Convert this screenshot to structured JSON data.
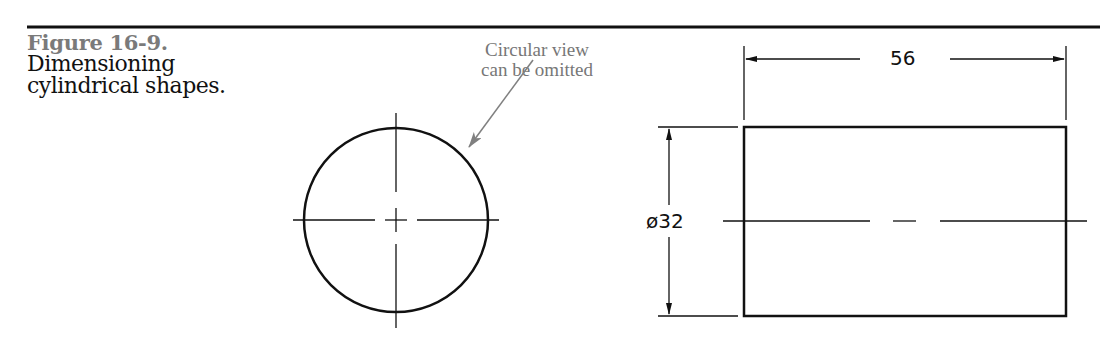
{
  "figure": {
    "number": "Figure 16-9.",
    "title_line1": "Dimensioning",
    "title_line2": "cylindrical shapes."
  },
  "callout": {
    "line1": "Circular view",
    "line2": "can be omitted"
  },
  "dimensions": {
    "length": "56",
    "diameter": "ø32"
  },
  "colors": {
    "line": "#111111",
    "callout": "#808080",
    "figure_number": "#7a7a7a"
  }
}
